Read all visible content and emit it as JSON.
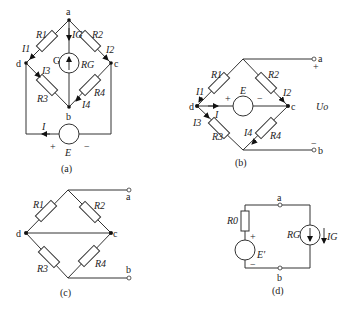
{
  "panels": {
    "a": {
      "caption": "(a)",
      "nodes": {
        "a": "a",
        "b": "b",
        "c": "c",
        "d": "d"
      },
      "resistors": [
        "R1",
        "R2",
        "R3",
        "R4"
      ],
      "galvanometer": {
        "symbol": "G",
        "resistance": "RG",
        "current": "IG"
      },
      "currents": [
        "I1",
        "I2",
        "I3",
        "I4",
        "I"
      ],
      "source": {
        "label": "E",
        "plus": "+",
        "minus": "−"
      }
    },
    "b": {
      "caption": "(b)",
      "nodes": {
        "a": "a",
        "b": "b",
        "c": "c",
        "d": "d"
      },
      "resistors": [
        "R1",
        "R2",
        "R3",
        "R4"
      ],
      "currents": [
        "I1",
        "I2",
        "I3",
        "I4",
        "I"
      ],
      "source": {
        "label": "E",
        "plus": "+",
        "minus": "−"
      },
      "output": {
        "label": "Uo",
        "plus": "+",
        "minus": "−"
      }
    },
    "c": {
      "caption": "(c)",
      "nodes": {
        "a": "a",
        "b": "b",
        "c": "c",
        "d": "d"
      },
      "resistors": [
        "R1",
        "R2",
        "R3",
        "R4"
      ]
    },
    "d": {
      "caption": "(d)",
      "nodes": {
        "a": "a",
        "b": "b"
      },
      "resistors": [
        "R0"
      ],
      "source": {
        "label": "E'",
        "plus": "+",
        "minus": "−"
      },
      "galvanometer": {
        "resistance": "RG",
        "current": "IG"
      }
    }
  }
}
